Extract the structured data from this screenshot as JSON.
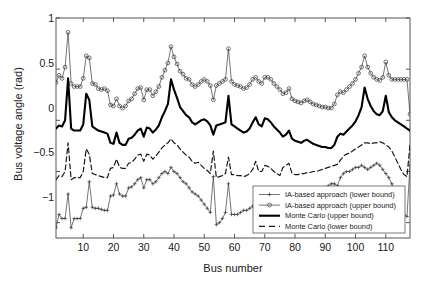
{
  "chart_data": {
    "type": "line",
    "title": "",
    "xlabel": "Bus number",
    "ylabel": "Bus voltage angle (rad)",
    "xlim": [
      1,
      118
    ],
    "ylim": [
      -1.15,
      1.0
    ],
    "xticks": [
      10,
      20,
      30,
      40,
      50,
      60,
      70,
      80,
      90,
      100,
      110
    ],
    "yticks": [
      1,
      0.5,
      0,
      -0.5,
      -1
    ],
    "ytick_labels": [
      "1",
      "0.5",
      "0",
      "−0.5",
      "−1"
    ],
    "grid": false,
    "legend_position": "lower right",
    "series": [
      {
        "name": "IA-based approach (lower bound)",
        "style": "solid-thin",
        "marker": "plus",
        "color": "#3a3a3a",
        "values": [
          -1.05,
          -0.92,
          -0.96,
          -0.96,
          -0.72,
          -1.05,
          -0.96,
          -0.96,
          -0.96,
          -0.86,
          -0.85,
          -0.6,
          -0.85,
          -0.86,
          -0.86,
          -0.87,
          -0.88,
          -0.88,
          -0.74,
          -0.73,
          -0.62,
          -0.72,
          -0.74,
          -0.74,
          -0.66,
          -0.65,
          -0.62,
          -0.58,
          -0.56,
          -0.66,
          -0.58,
          -0.58,
          -0.62,
          -0.6,
          -0.56,
          -0.52,
          -0.5,
          -0.52,
          -0.46,
          -0.5,
          -0.52,
          -0.56,
          -0.6,
          -0.62,
          -0.66,
          -0.7,
          -0.72,
          -0.74,
          -0.78,
          -0.82,
          -0.86,
          -0.9,
          -0.55,
          -1.02,
          -1.0,
          -0.96,
          -0.9,
          -0.62,
          -0.92,
          -0.92,
          -0.92,
          -0.9,
          -0.88,
          -0.88,
          -0.86,
          -0.84,
          -0.72,
          -0.88,
          -0.86,
          -0.86,
          -0.84,
          -0.84,
          -0.8,
          -0.74,
          -0.86,
          -0.88,
          -0.88,
          -0.86,
          -0.84,
          -0.82,
          -0.8,
          -0.8,
          -0.78,
          -0.76,
          -0.74,
          -0.74,
          -0.72,
          -0.7,
          -0.68,
          -0.66,
          -0.64,
          -0.62,
          -0.62,
          -0.64,
          -0.56,
          -0.52,
          -0.5,
          -0.5,
          -0.48,
          -0.46,
          -0.46,
          -0.44,
          -0.46,
          -0.48,
          -0.46,
          -0.44,
          -0.42,
          -0.44,
          -0.48,
          -0.52,
          -0.56,
          -0.62,
          -0.7,
          -0.78,
          -0.86,
          -0.92,
          -0.94,
          -0.44
        ]
      },
      {
        "name": "IA-based approach (upper bound)",
        "style": "solid-thin",
        "marker": "circle",
        "color": "#3a3a3a",
        "values": [
          0.37,
          0.44,
          0.41,
          0.52,
          0.86,
          0.36,
          0.33,
          0.33,
          0.33,
          0.41,
          0.63,
          0.61,
          0.36,
          0.35,
          0.31,
          0.3,
          0.31,
          0.29,
          0.15,
          0.14,
          0.21,
          0.14,
          0.12,
          0.14,
          0.19,
          0.21,
          0.26,
          0.31,
          0.32,
          0.2,
          0.3,
          0.3,
          0.24,
          0.28,
          0.33,
          0.42,
          0.49,
          0.56,
          0.72,
          0.62,
          0.55,
          0.48,
          0.45,
          0.41,
          0.4,
          0.35,
          0.33,
          0.35,
          0.38,
          0.4,
          0.38,
          0.34,
          0.2,
          0.34,
          0.36,
          0.38,
          0.4,
          0.7,
          0.38,
          0.35,
          0.34,
          0.33,
          0.31,
          0.32,
          0.35,
          0.4,
          0.42,
          0.38,
          0.36,
          0.42,
          0.42,
          0.4,
          0.36,
          0.33,
          0.3,
          0.26,
          0.27,
          0.31,
          0.21,
          0.19,
          0.18,
          0.17,
          0.19,
          0.2,
          0.18,
          0.16,
          0.15,
          0.14,
          0.13,
          0.13,
          0.12,
          0.12,
          0.16,
          0.25,
          0.28,
          0.27,
          0.3,
          0.33,
          0.36,
          0.4,
          0.46,
          0.52,
          0.63,
          0.52,
          0.46,
          0.42,
          0.4,
          0.39,
          0.42,
          0.57,
          0.44,
          0.4,
          0.4,
          0.4,
          0.4,
          0.4,
          0.4,
          0.06
        ]
      },
      {
        "name": "Monte Carlo (upper bound)",
        "style": "solid-thick",
        "marker": "none",
        "color": "#000000",
        "values": [
          -0.08,
          -0.05,
          -0.06,
          0.0,
          0.41,
          -0.08,
          -0.1,
          -0.1,
          -0.1,
          -0.04,
          0.26,
          0.2,
          -0.06,
          -0.08,
          -0.1,
          -0.11,
          -0.12,
          -0.13,
          -0.22,
          -0.23,
          -0.12,
          -0.22,
          -0.24,
          -0.24,
          -0.18,
          -0.17,
          -0.14,
          -0.1,
          -0.08,
          -0.16,
          -0.07,
          -0.08,
          -0.12,
          -0.09,
          -0.05,
          0.03,
          0.09,
          0.16,
          0.4,
          0.3,
          0.22,
          0.13,
          0.09,
          0.05,
          0.03,
          -0.02,
          -0.04,
          -0.02,
          0.0,
          0.01,
          -0.01,
          -0.05,
          -0.14,
          -0.05,
          -0.04,
          -0.03,
          -0.02,
          0.24,
          -0.04,
          -0.06,
          -0.08,
          -0.1,
          -0.12,
          -0.11,
          -0.08,
          -0.02,
          0.03,
          -0.04,
          -0.06,
          0.02,
          0.01,
          -0.02,
          -0.06,
          -0.09,
          -0.12,
          -0.16,
          -0.14,
          -0.1,
          -0.18,
          -0.2,
          -0.21,
          -0.22,
          -0.2,
          -0.19,
          -0.21,
          -0.23,
          -0.24,
          -0.25,
          -0.26,
          -0.26,
          -0.27,
          -0.27,
          -0.24,
          -0.16,
          -0.13,
          -0.14,
          -0.11,
          -0.08,
          -0.05,
          -0.01,
          0.05,
          0.13,
          0.32,
          0.21,
          0.14,
          0.09,
          0.06,
          0.05,
          0.09,
          0.24,
          0.08,
          0.03,
          0.0,
          -0.02,
          -0.04,
          -0.06,
          -0.08,
          -0.1
        ]
      },
      {
        "name": "Monte Carlo (lower bound)",
        "style": "dashed",
        "marker": "none",
        "color": "#1a1a1a",
        "values": [
          -0.58,
          -0.54,
          -0.55,
          -0.5,
          -0.22,
          -0.58,
          -0.56,
          -0.56,
          -0.56,
          -0.5,
          -0.28,
          -0.33,
          -0.52,
          -0.53,
          -0.54,
          -0.55,
          -0.56,
          -0.56,
          -0.47,
          -0.46,
          -0.38,
          -0.46,
          -0.47,
          -0.47,
          -0.42,
          -0.41,
          -0.38,
          -0.34,
          -0.33,
          -0.4,
          -0.33,
          -0.34,
          -0.38,
          -0.35,
          -0.31,
          -0.27,
          -0.24,
          -0.22,
          -0.18,
          -0.22,
          -0.24,
          -0.28,
          -0.31,
          -0.34,
          -0.36,
          -0.4,
          -0.42,
          -0.41,
          -0.44,
          -0.47,
          -0.49,
          -0.52,
          -0.3,
          -0.56,
          -0.55,
          -0.54,
          -0.52,
          -0.36,
          -0.53,
          -0.53,
          -0.54,
          -0.54,
          -0.55,
          -0.54,
          -0.52,
          -0.48,
          -0.4,
          -0.5,
          -0.5,
          -0.44,
          -0.45,
          -0.47,
          -0.5,
          -0.52,
          -0.54,
          -0.46,
          -0.44,
          -0.42,
          -0.52,
          -0.53,
          -0.53,
          -0.52,
          -0.52,
          -0.51,
          -0.51,
          -0.5,
          -0.5,
          -0.49,
          -0.48,
          -0.47,
          -0.46,
          -0.45,
          -0.44,
          -0.43,
          -0.39,
          -0.35,
          -0.33,
          -0.32,
          -0.3,
          -0.28,
          -0.26,
          -0.24,
          -0.22,
          -0.22,
          -0.23,
          -0.22,
          -0.22,
          -0.21,
          -0.22,
          -0.24,
          -0.26,
          -0.3,
          -0.36,
          -0.42,
          -0.48,
          -0.53,
          -0.55,
          -0.24
        ]
      }
    ]
  },
  "legend": {
    "items": [
      {
        "label": "IA-based approach (lower bound)",
        "sample": "line-plus"
      },
      {
        "label": "IA-based approach (upper bound)",
        "sample": "line-circle"
      },
      {
        "label": "Monte Carlo (upper bound)",
        "sample": "line-solid-thick"
      },
      {
        "label": "Monte Carlo (lower bound)",
        "sample": "line-dashed"
      }
    ]
  },
  "axes": {
    "ylabel": "Bus voltage angle (rad)",
    "xlabel": "Bus number",
    "ytick_labels": [
      "1",
      "0.5",
      "0",
      "−0.5",
      "−1"
    ],
    "xtick_labels": [
      "10",
      "20",
      "30",
      "40",
      "50",
      "60",
      "70",
      "80",
      "90",
      "100",
      "110"
    ]
  },
  "colors": {
    "axis": "#555555",
    "thin_series": "#3a3a3a",
    "thick_series": "#000000",
    "background": "#ffffff"
  }
}
